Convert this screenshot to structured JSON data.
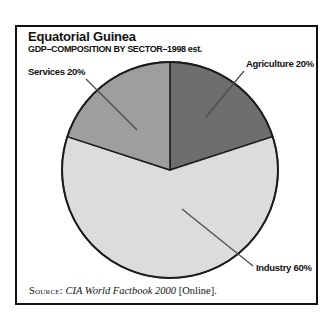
{
  "header": {
    "title": "Equatorial Guinea",
    "subtitle": "GDP–COMPOSITION BY SECTOR–1998 est."
  },
  "chart_data": {
    "type": "pie",
    "title": "GDP–COMPOSITION BY SECTOR–1998 est.",
    "categories": [
      "Agriculture",
      "Industry",
      "Services"
    ],
    "values": [
      20,
      60,
      20
    ],
    "unit": "%",
    "slice_labels": [
      "Agriculture 20%",
      "Industry 60%",
      "Services 20%"
    ],
    "colors": [
      "#6e6e6e",
      "#dcdcdc",
      "#9e9e9e"
    ],
    "outline_color": "#1c1c1c",
    "leader_line_color": "#4a4a4a",
    "start_angle_deg": 90,
    "direction": "clockwise",
    "legend": "none"
  },
  "source": {
    "prefix": "Source:",
    "work": "CIA World Factbook 2000",
    "suffix": "[Online]."
  }
}
